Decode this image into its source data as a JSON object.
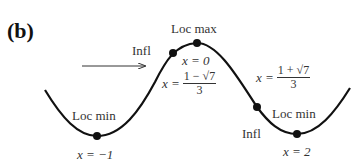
{
  "panel_label": "(b)",
  "labels": {
    "loc_max": "Loc max",
    "loc_max_x": "x = 0",
    "infl_left": "Infl",
    "infl_left_x_prefix": "x =",
    "infl_left_x_num": "1 − √7",
    "infl_left_x_den": "3",
    "infl_right": "Infl",
    "infl_right_x_prefix": "x =",
    "infl_right_x_num": "1 + √7",
    "infl_right_x_den": "3",
    "loc_min_left": "Loc min",
    "loc_min_left_x": "x = −1",
    "loc_min_right": "Loc min",
    "loc_min_right_x": "x = 2"
  },
  "colors": {
    "curve": "#111111",
    "text": "#333333",
    "background": "#ffffff"
  },
  "points": [
    {
      "name": "loc-min-left",
      "x": -1
    },
    {
      "name": "infl-left",
      "x": "(1-√7)/3"
    },
    {
      "name": "loc-max",
      "x": 0
    },
    {
      "name": "infl-right",
      "x": "(1+√7)/3"
    },
    {
      "name": "loc-min-right",
      "x": 2
    }
  ]
}
